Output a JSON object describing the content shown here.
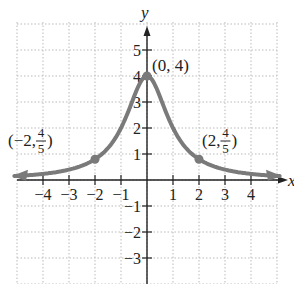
{
  "chart_data": {
    "type": "line",
    "title": "",
    "function": "f(x) = 4/(x^2+1)",
    "xlabel": "x",
    "ylabel": "y",
    "xlim": [
      -5,
      5
    ],
    "ylim": [
      -4,
      6
    ],
    "grid": true,
    "x_ticks": [
      -4,
      -3,
      -2,
      -1,
      1,
      2,
      3,
      4
    ],
    "y_ticks": [
      -3,
      -2,
      -1,
      1,
      2,
      3,
      4,
      5
    ],
    "x_tick_labels": [
      "−4",
      "−3",
      "−2",
      "−1",
      "1",
      "2",
      "3",
      "4"
    ],
    "y_tick_labels": [
      "−3",
      "−2",
      "−1",
      "1",
      "2",
      "3",
      "4",
      "5"
    ],
    "series": [
      {
        "name": "curve",
        "color": "#7a7a7a",
        "x": [
          -5,
          -4,
          -3,
          -2,
          -1,
          0,
          1,
          2,
          3,
          4,
          5
        ],
        "y": [
          0.154,
          0.235,
          0.4,
          0.8,
          2,
          4,
          2,
          0.8,
          0.4,
          0.235,
          0.154
        ]
      }
    ],
    "points": [
      {
        "x": -2,
        "y": 0.8,
        "label_pre": "(−2, ",
        "num": "4",
        "den": "5",
        "label_post": ")"
      },
      {
        "x": 0,
        "y": 4,
        "label": "(0, 4)"
      },
      {
        "x": 2,
        "y": 0.8,
        "label_pre": "(2, ",
        "num": "4",
        "den": "5",
        "label_post": ")"
      }
    ]
  }
}
